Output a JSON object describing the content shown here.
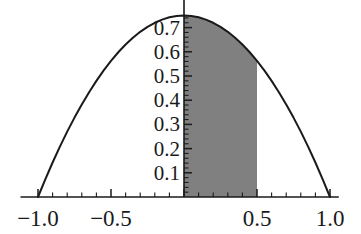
{
  "chart_data": {
    "type": "area",
    "title": "",
    "subtitle": "",
    "xlabel": "",
    "ylabel": "",
    "xlim": [
      -1.12,
      1.06
    ],
    "ylim": [
      0,
      0.82
    ],
    "grid": false,
    "legend": null,
    "curve": {
      "name": "f(x) = 0.75 (1 - x^2)",
      "formula_a": 0.75,
      "domain": [
        -1.0,
        1.0
      ],
      "peak_x": 0.0,
      "peak_y": 0.75,
      "color": "#1a1a1a",
      "line_width": 2.0,
      "x": [
        -1.0,
        -0.95,
        -0.9,
        -0.85,
        -0.8,
        -0.75,
        -0.7,
        -0.65,
        -0.6,
        -0.55,
        -0.5,
        -0.45,
        -0.4,
        -0.35,
        -0.3,
        -0.25,
        -0.2,
        -0.15,
        -0.1,
        -0.05,
        0.0,
        0.05,
        0.1,
        0.15,
        0.2,
        0.25,
        0.3,
        0.35,
        0.4,
        0.45,
        0.5,
        0.55,
        0.6,
        0.65,
        0.7,
        0.75,
        0.8,
        0.85,
        0.9,
        0.95,
        1.0
      ],
      "y": [
        0.0,
        0.0731,
        0.1425,
        0.2081,
        0.27,
        0.3281,
        0.3825,
        0.4331,
        0.48,
        0.5231,
        0.5625,
        0.5981,
        0.63,
        0.6581,
        0.6825,
        0.7031,
        0.72,
        0.7331,
        0.7425,
        0.7481,
        0.75,
        0.7481,
        0.7425,
        0.7331,
        0.72,
        0.7031,
        0.6825,
        0.6581,
        0.63,
        0.5981,
        0.5625,
        0.5231,
        0.48,
        0.4331,
        0.3825,
        0.3281,
        0.27,
        0.2081,
        0.1425,
        0.0731,
        0.0
      ]
    },
    "shaded_region": {
      "name": "shaded-area-0-to-0.5",
      "x_start": 0.0,
      "x_end": 0.5,
      "fill_color": "#808080",
      "area_value": 0.34375,
      "description": "Region under the curve between x = 0 and x = 0.5"
    },
    "x_axis": {
      "tick_labels": [
        "-1.0",
        "-0.5",
        "0.5",
        "1.0"
      ],
      "tick_values": [
        -1.0,
        -0.5,
        0.5,
        1.0
      ],
      "minor_tick_step": 0.1,
      "major_tick_step": 0.5,
      "axis_color": "#1a1a1a"
    },
    "y_axis": {
      "tick_labels": [
        "0.7",
        "0.6",
        "0.5",
        "0.4",
        "0.3",
        "0.2",
        "0.1"
      ],
      "tick_values": [
        0.7,
        0.6,
        0.5,
        0.4,
        0.3,
        0.2,
        0.1
      ],
      "minor_tick_step": 0.02,
      "major_tick_step": 0.1,
      "axis_position_x": 0.0,
      "axis_color": "#1a1a1a"
    }
  }
}
